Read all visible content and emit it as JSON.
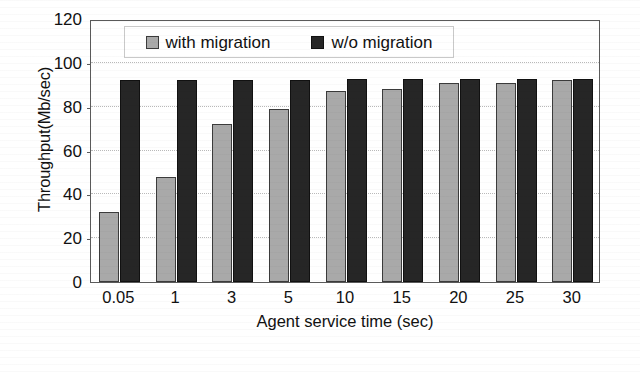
{
  "chart_data": {
    "type": "bar",
    "title": "",
    "xlabel": "Agent service time (sec)",
    "ylabel": "Throughput(Mb/sec)",
    "categories": [
      "0.05",
      "1",
      "3",
      "5",
      "10",
      "15",
      "20",
      "25",
      "30"
    ],
    "series": [
      {
        "name": "with migration",
        "color": "#a9a9a9",
        "values": [
          32,
          48,
          72,
          79,
          87,
          88,
          91,
          91,
          92
        ]
      },
      {
        "name": "w/o migration",
        "color": "#262626",
        "values": [
          92,
          92,
          92,
          92,
          92.5,
          92.5,
          92.5,
          92.5,
          92.5
        ]
      }
    ],
    "ylim": [
      0,
      120
    ],
    "yticks": [
      "0",
      "20",
      "40",
      "60",
      "80",
      "100",
      "120"
    ],
    "ytick_values": [
      0,
      20,
      40,
      60,
      80,
      100,
      120
    ],
    "grid": "horizontal-dotted",
    "legend_position": "top-center",
    "legend_entries": [
      "with migration",
      "w/o migration"
    ]
  }
}
